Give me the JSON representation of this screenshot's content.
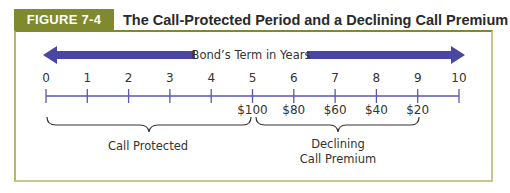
{
  "figure": {
    "label": "FIGURE 7-4",
    "title": "The Call-Protected Period and a Declining Call Premium",
    "label_bg_color": "#7f8a2e"
  },
  "arrow": {
    "label": "Bond’s Term in Years",
    "color": "#4a47a3",
    "direction": "bidirectional"
  },
  "timeline": {
    "ticks": [
      "0",
      "1",
      "2",
      "3",
      "4",
      "5",
      "6",
      "7",
      "8",
      "9",
      "10"
    ],
    "premiums": [
      {
        "year": 5,
        "label": "$100"
      },
      {
        "year": 6,
        "label": "$80"
      },
      {
        "year": 7,
        "label": "$60"
      },
      {
        "year": 8,
        "label": "$40"
      },
      {
        "year": 9,
        "label": "$20"
      }
    ],
    "axis_color": "#5a57b0"
  },
  "braces": [
    {
      "from": 0,
      "to": 5,
      "label_lines": [
        "Call Protected"
      ]
    },
    {
      "from": 5,
      "to": 9,
      "label_lines": [
        "Declining",
        "Call Premium"
      ]
    }
  ]
}
